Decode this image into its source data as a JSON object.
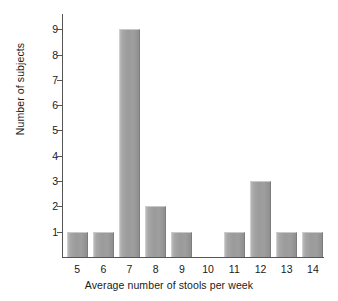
{
  "chart_data": {
    "type": "bar",
    "title": "",
    "subtitle": "",
    "xlabel": "Average number of stools per week",
    "ylabel": "Number of subjects",
    "categories": [
      "5",
      "6",
      "7",
      "8",
      "9",
      "10",
      "11",
      "12",
      "13",
      "14"
    ],
    "values": [
      1,
      1,
      9,
      2,
      1,
      0,
      1,
      3,
      1,
      1
    ],
    "series": [
      {
        "name": "Number of subjects",
        "values": [
          1,
          1,
          9,
          2,
          1,
          0,
          1,
          3,
          1,
          1
        ]
      }
    ],
    "y_ticks": [
      1,
      2,
      3,
      4,
      5,
      6,
      7,
      8,
      9
    ],
    "y_tick_labels": [
      "1",
      "2",
      "3",
      "4",
      "5",
      "6",
      "7",
      "8",
      "9"
    ],
    "ylim": [
      0,
      9.6
    ],
    "xlim": [
      4.5,
      14.5
    ],
    "grid": false,
    "legend": false,
    "legend_position": "none",
    "annotations": [],
    "colors": {
      "bar_fill": "#9b9b9b",
      "bar_highlight": "#b9b9b9",
      "bar_shadow": "#8f8f8f",
      "axis": "#555555",
      "text": "#1a1a1a",
      "background": "#ffffff"
    }
  }
}
